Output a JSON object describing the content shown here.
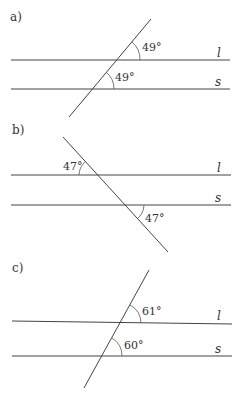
{
  "panels": [
    {
      "label": "a)",
      "line_top": "l",
      "line_bottom": "s",
      "angle_top": "49°",
      "angle_bottom": "49°"
    },
    {
      "label": "b)",
      "line_top": "l",
      "line_bottom": "s",
      "angle_top": "47°",
      "angle_bottom": "47°"
    },
    {
      "label": "c)",
      "line_top": "l",
      "line_bottom": "s",
      "angle_top": "61°",
      "angle_bottom": "60°"
    }
  ]
}
